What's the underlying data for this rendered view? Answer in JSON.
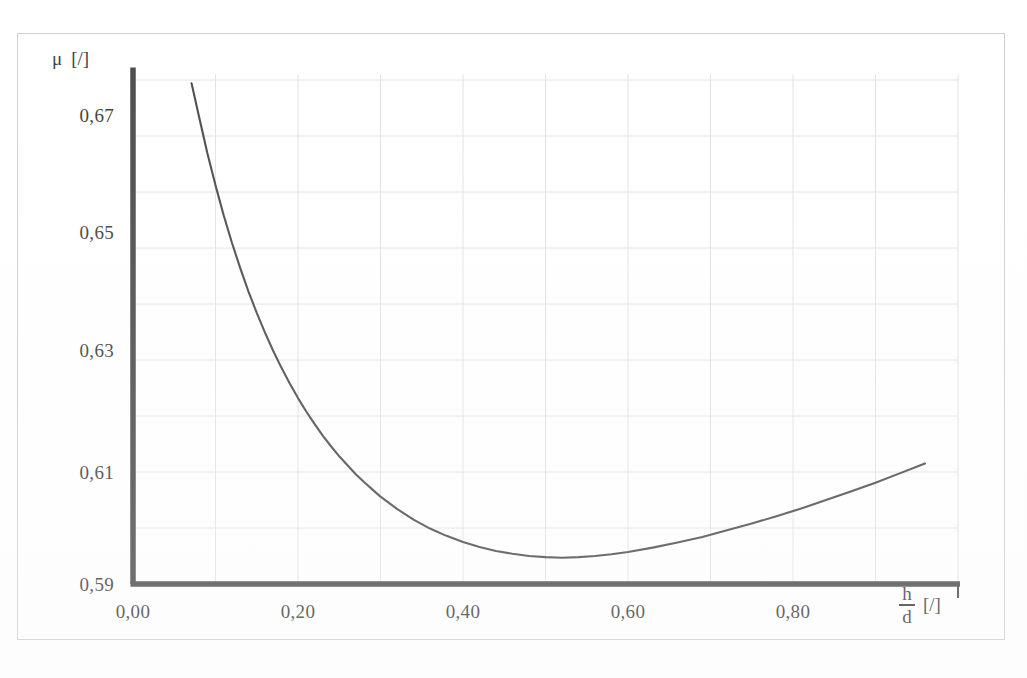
{
  "figure": {
    "background_color": "#ffffff",
    "frame_color": "#cfcfcf",
    "axis_color": "#4a4a4a",
    "grid_color": "#e2e2e2",
    "curve_color": "#4a4a4a"
  },
  "axes": {
    "y_title_symbol": "μ",
    "y_title_unit": "[/]",
    "x_title_numerator": "h",
    "x_title_denominator": "d",
    "x_title_unit": "[/]",
    "y_ticks": [
      "0,67",
      "0,65",
      "0,63",
      "0,61",
      "0,59"
    ],
    "x_ticks": [
      "0,00",
      "0,20",
      "0,40",
      "0,60",
      "0,80"
    ]
  },
  "chart_data": {
    "type": "line",
    "title": "",
    "subtitle": "",
    "xlabel": "h/d [/]",
    "ylabel": "μ [/]",
    "xlim": [
      0.0,
      1.0
    ],
    "ylim": [
      0.59,
      0.681
    ],
    "xticks": [
      0.0,
      0.2,
      0.4,
      0.6,
      0.8
    ],
    "xticklabels": [
      "0,00",
      "0,20",
      "0,40",
      "0,60",
      "0,80"
    ],
    "yticks": [
      0.59,
      0.61,
      0.63,
      0.65,
      0.67
    ],
    "yticklabels": [
      "0,59",
      "0,61",
      "0,63",
      "0,65",
      "0,67"
    ],
    "grid": true,
    "grid_minor_x_step": 0.1,
    "grid_minor_y_step": 0.01,
    "legend": null,
    "decimal_separator": ",",
    "series": [
      {
        "name": "μ(h/d)",
        "color": "#4a4a4a",
        "linewidth": 2.1,
        "x": [
          0.071,
          0.08,
          0.09,
          0.1,
          0.11,
          0.12,
          0.13,
          0.14,
          0.15,
          0.16,
          0.17,
          0.18,
          0.19,
          0.2,
          0.21,
          0.22,
          0.23,
          0.24,
          0.25,
          0.26,
          0.27,
          0.28,
          0.29,
          0.3,
          0.32,
          0.34,
          0.36,
          0.38,
          0.4,
          0.42,
          0.44,
          0.46,
          0.48,
          0.5,
          0.52,
          0.54,
          0.56,
          0.58,
          0.6,
          0.63,
          0.66,
          0.69,
          0.72,
          0.75,
          0.78,
          0.81,
          0.84,
          0.87,
          0.9,
          0.93,
          0.96
        ],
        "y": [
          0.6794,
          0.6735,
          0.667,
          0.6612,
          0.6558,
          0.6509,
          0.6464,
          0.6422,
          0.6384,
          0.6349,
          0.6316,
          0.6286,
          0.6258,
          0.6232,
          0.6208,
          0.6186,
          0.6165,
          0.6146,
          0.6128,
          0.6112,
          0.6096,
          0.6082,
          0.6069,
          0.6056,
          0.6034,
          0.6015,
          0.5999,
          0.5986,
          0.5975,
          0.5966,
          0.5959,
          0.5954,
          0.595,
          0.5948,
          0.5947,
          0.5948,
          0.595,
          0.5953,
          0.5957,
          0.5965,
          0.5974,
          0.5984,
          0.5996,
          0.6008,
          0.6021,
          0.6035,
          0.605,
          0.6065,
          0.6081,
          0.6098,
          0.6115
        ]
      }
    ],
    "annotations": {
      "minimum_approx_x": 0.5,
      "minimum_approx_y": 0.5947,
      "start_x": 0.071,
      "start_y": 0.6794,
      "end_x": 0.96,
      "end_y": 0.6115
    }
  }
}
